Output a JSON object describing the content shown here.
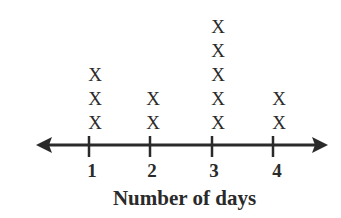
{
  "chart_data": {
    "type": "line_plot",
    "title": "",
    "xlabel": "Number of days",
    "ylabel": "",
    "categories": [
      "1",
      "2",
      "3",
      "4"
    ],
    "values": [
      3,
      2,
      5,
      2
    ],
    "marker": "X",
    "grid": false,
    "legend": null
  },
  "axis": {
    "label": "Number of days",
    "ticks": [
      "1",
      "2",
      "3",
      "4"
    ]
  },
  "colors": {
    "ink": "#2a2a2a",
    "background": "#ffffff"
  }
}
